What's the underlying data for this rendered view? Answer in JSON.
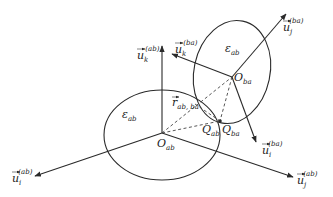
{
  "diagram": {
    "type": "geometric vector diagram of two intersecting ellipsoids",
    "stroke_color": "#2a2a2a",
    "background": "#ffffff",
    "ellipses": [
      {
        "name": "ellipse-ab",
        "label": "ε",
        "label_sub": "ab"
      },
      {
        "name": "ellipse-ba",
        "label": "ε",
        "label_sub": "ab"
      }
    ],
    "points": {
      "o_ab": {
        "main": "O",
        "sub": "ab"
      },
      "o_ba": {
        "main": "O",
        "sub": "ba"
      },
      "q_ab": {
        "main": "Q",
        "sub": "ab"
      },
      "q_ba": {
        "main": "Q",
        "sub": "ba"
      }
    },
    "vectors": {
      "u_k_ab": {
        "main": "u",
        "sub": "k",
        "sup": "(ab)"
      },
      "u_i_ab": {
        "main": "u",
        "sub": "i",
        "sup": "(ab)"
      },
      "u_j_ab": {
        "main": "u",
        "sub": "j",
        "sup": "(ab)"
      },
      "u_k_ba": {
        "main": "u",
        "sub": "k",
        "sup": "(ba)"
      },
      "u_j_ba": {
        "main": "u",
        "sub": "j",
        "sup": "(ba)"
      },
      "u_i_ba": {
        "main": "u",
        "sub": "i",
        "sup": "(ba)"
      },
      "r_ab_ba": {
        "main": "r",
        "sub": "ab, ba"
      }
    }
  }
}
